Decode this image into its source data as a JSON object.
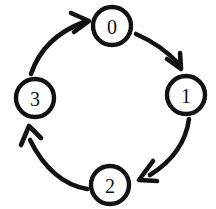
{
  "diagram": {
    "type": "directed-cycle-graph",
    "title": "",
    "background_color": "#ffffff",
    "stroke_color": "#121212",
    "node_fill_color": "#ffffff",
    "style": "hand-drawn",
    "direction": "clockwise",
    "node_radius": 19,
    "nodes": [
      {
        "id": "0",
        "label": "0",
        "position": "top",
        "cx": 112,
        "cy": 26
      },
      {
        "id": "1",
        "label": "1",
        "position": "right",
        "cx": 186,
        "cy": 95
      },
      {
        "id": "2",
        "label": "2",
        "position": "bottom",
        "cx": 110,
        "cy": 185
      },
      {
        "id": "3",
        "label": "3",
        "position": "left",
        "cx": 35,
        "cy": 98
      }
    ],
    "edges": [
      {
        "id": "e0",
        "from": "0",
        "to": "1",
        "label": "",
        "curve": "clockwise-arc"
      },
      {
        "id": "e1",
        "from": "1",
        "to": "2",
        "label": "",
        "curve": "clockwise-arc"
      },
      {
        "id": "e2",
        "from": "2",
        "to": "3",
        "label": "",
        "curve": "clockwise-arc"
      },
      {
        "id": "e3",
        "from": "3",
        "to": "0",
        "label": "",
        "curve": "clockwise-arc"
      }
    ]
  }
}
